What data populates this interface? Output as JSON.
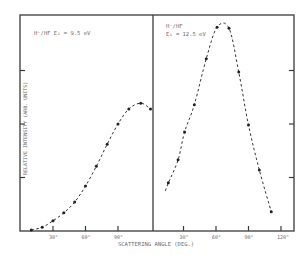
{
  "chart_data": [
    {
      "type": "scatter",
      "panel": "left",
      "annotation": "H⁻/HF   E₁ = 9.5 eV",
      "xlabel": "SCATTERING ANGLE (DEG.)",
      "ylabel": "RELATIVE INTENSITY (ARB. UNITS)",
      "x_ticks": [
        "30°",
        "60°",
        "90°"
      ],
      "xlim": [
        0,
        122
      ],
      "ylim": [
        0,
        4
      ],
      "grid": false,
      "series": [
        {
          "name": "E1 = 9.5 eV",
          "x": [
            10,
            20,
            30,
            40,
            50,
            60,
            70,
            80,
            90,
            100,
            111,
            120
          ],
          "y": [
            0.02,
            0.07,
            0.19,
            0.34,
            0.54,
            0.84,
            1.21,
            1.62,
            2.0,
            2.28,
            2.39,
            2.28
          ]
        }
      ]
    },
    {
      "type": "scatter",
      "panel": "right",
      "annotation": "H⁻/HF   E₁ = 12.5 eV",
      "xlabel": "SCATTERING ANGLE (DEG.)",
      "ylabel": "RELATIVE INTENSITY (ARB. UNITS)",
      "x_ticks": [
        "30°",
        "60°",
        "90°",
        "120°"
      ],
      "xlim": [
        0,
        128
      ],
      "ylim": [
        0,
        4
      ],
      "grid": false,
      "series": [
        {
          "name": "E1 = 12.5 eV",
          "x": [
            16,
            25,
            31,
            40,
            51,
            61,
            72,
            81,
            90,
            100,
            111
          ],
          "y": [
            0.9,
            1.33,
            1.85,
            2.36,
            3.22,
            3.81,
            3.79,
            2.97,
            1.98,
            1.14,
            0.36
          ]
        }
      ]
    }
  ],
  "labels": {
    "left_title": "H⁻/HF    E₁ = 9.5 eV",
    "right_title_line1": "H⁻/HF",
    "right_title_line2": "E₁ = 12.5 eV",
    "ylabel": "RELATIVE INTENSITY (ARB. UNITS)",
    "xlabel": "SCATTERING ANGLE (DEG.)",
    "left_ticks": [
      "30°",
      "60°",
      "90°"
    ],
    "right_ticks": [
      "30°",
      "60°",
      "90°",
      "120°"
    ]
  }
}
